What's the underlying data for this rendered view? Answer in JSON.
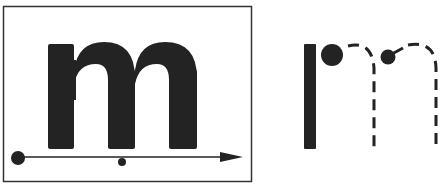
{
  "diagram": {
    "left_panel": {
      "letter": "m",
      "description": "Solid letter m in a frame with a directional baseline arrow",
      "color": "#222222"
    },
    "right_panel": {
      "description": "Stroke-order guide for letter m: solid first stroke, dashed arches with start dots"
    }
  }
}
